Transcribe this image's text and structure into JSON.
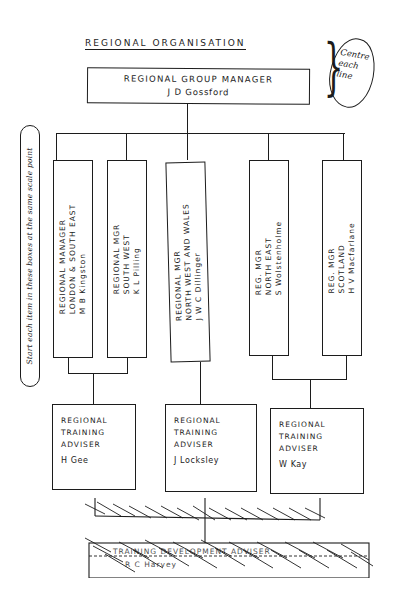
{
  "title": "REGIONAL ORGANISATION",
  "annotations": {
    "right_note": [
      "Centre",
      "each",
      "line"
    ],
    "left_note": "Start each item in these boxes at the same scale point"
  },
  "top": {
    "role": "REGIONAL GROUP MANAGER",
    "name": "J D Gossford"
  },
  "regional_managers": [
    {
      "lines": [
        "REGIONAL MANAGER",
        "LONDON & SOUTH EAST",
        "M B Kingston"
      ]
    },
    {
      "lines": [
        "REGIONAL MGR",
        "SOUTH WEST",
        "K L Pilling"
      ]
    },
    {
      "lines": [
        "REGIONAL MGR",
        "NORTH WEST AND WALES",
        "J W C Dillinger"
      ]
    },
    {
      "lines": [
        "REG. MGR",
        "NORTH EAST",
        "S Wolstenholme"
      ]
    },
    {
      "lines": [
        "REG. MGR",
        "SCOTLAND",
        "H V Macfarlane"
      ]
    }
  ],
  "training_advisers": [
    {
      "role": [
        "REGIONAL",
        "TRAINING",
        "ADVISER"
      ],
      "name": "H Gee"
    },
    {
      "role": [
        "REGIONAL",
        "TRAINING",
        "ADVISER"
      ],
      "name": "J Locksley"
    },
    {
      "role": [
        "REGIONAL",
        "TRAINING",
        "ADVISER"
      ],
      "name": "W Kay"
    }
  ],
  "crossed_out": {
    "role": "TRAINING DEVELOPMENT ADVISER",
    "name": "R C Harvey"
  }
}
